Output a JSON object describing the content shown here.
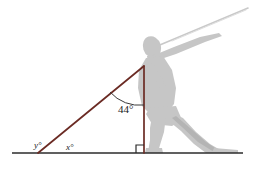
{
  "figure": {
    "colors": {
      "background": "#ffffff",
      "silhouette": "#c6c6c6",
      "silhouette_shade": "#b4b4b4",
      "javelin": "#c9c9c9",
      "triangle": "#6b2b24",
      "ground": "#2b2b2b",
      "arc": "#3a3a3a",
      "label": "#1a1a1a"
    },
    "labels": {
      "angle_at_apex": "44°",
      "angle_ground_right": "x°",
      "angle_ground_left": "y°"
    },
    "geometry": {
      "ground_line": {
        "x1": 12,
        "y1": 153,
        "x2": 243,
        "y2": 153
      },
      "apex": {
        "x": 144,
        "y": 66
      },
      "left_vertex": {
        "x": 38,
        "y": 153
      },
      "right_vertex": {
        "x": 144,
        "y": 153
      },
      "right_angle_marker_size": 8,
      "javelin": {
        "x1": 155,
        "y1": 47,
        "x2": 248,
        "y2": 8
      }
    },
    "label_positions": {
      "angle_at_apex": {
        "x": 118,
        "y": 113
      },
      "angle_ground_right": {
        "x": 66,
        "y": 150
      },
      "angle_ground_left": {
        "x": 34,
        "y": 148
      }
    }
  }
}
